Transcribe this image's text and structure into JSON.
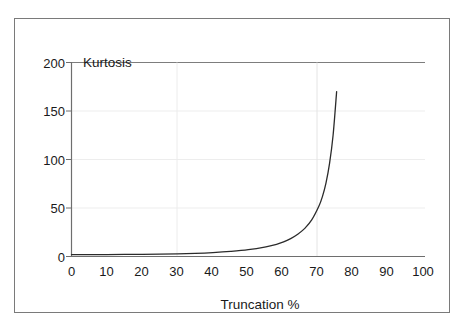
{
  "chart_data": {
    "type": "line",
    "title": "",
    "xlabel": "Truncation %",
    "ylabel": "Kurtosis",
    "xlim": [
      0,
      100
    ],
    "ylim": [
      0,
      200
    ],
    "xticks": [
      "0",
      "10",
      "20",
      "30",
      "40",
      "50",
      "60",
      "70",
      "80",
      "90",
      "100"
    ],
    "yticks": [
      "0",
      "50",
      "100",
      "150",
      "200"
    ],
    "grid": true,
    "legend": false,
    "series": [
      {
        "name": "Kurtosis vs Truncation",
        "x": [
          0,
          5,
          10,
          15,
          20,
          25,
          30,
          35,
          40,
          45,
          50,
          55,
          58,
          60,
          62,
          64,
          66,
          68,
          70,
          71,
          72,
          73,
          74,
          75
        ],
        "values": [
          2.0,
          2.0,
          2.0,
          2.1,
          2.2,
          2.4,
          2.7,
          3.2,
          4.0,
          5.2,
          7.0,
          10.0,
          12.5,
          15.0,
          18.5,
          23.0,
          29.0,
          38.0,
          52.0,
          62.0,
          76.0,
          96.0,
          125.0,
          170.0
        ]
      }
    ],
    "line_color": "#2b2b2b",
    "grid_color": "#e8e8e8",
    "axis_color": "#6e6e6e",
    "frame_color": "#7a7a7a"
  },
  "axes": {
    "y_title": "Kurtosis",
    "x_title": "Truncation %"
  }
}
